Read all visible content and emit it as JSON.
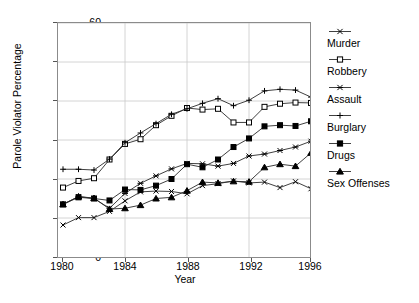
{
  "chart_data": {
    "type": "line",
    "title": "",
    "xlabel": "Year",
    "ylabel": "Parole Violator Percentage",
    "xlim": [
      1980,
      1996
    ],
    "ylim": [
      0,
      60
    ],
    "xticks": [
      1980,
      1984,
      1988,
      1992,
      1996
    ],
    "yticks": [
      0,
      10,
      20,
      30,
      40,
      50,
      60
    ],
    "grid": true,
    "legend_position": "right",
    "x": [
      1980,
      1981,
      1982,
      1983,
      1984,
      1985,
      1986,
      1987,
      1988,
      1989,
      1990,
      1991,
      1992,
      1993,
      1994,
      1995,
      1996
    ],
    "series": [
      {
        "name": "Murder",
        "marker": "x",
        "values": [
          8.2,
          10.1,
          10.1,
          11.7,
          14.4,
          16.7,
          16.9,
          16.8,
          16.2,
          18.3,
          18.8,
          19.5,
          19.0,
          19.2,
          17.8,
          19.3,
          17.5
        ]
      },
      {
        "name": "Robbery",
        "marker": "square-open",
        "values": [
          17.8,
          19.5,
          20.2,
          25.0,
          29.0,
          30.2,
          33.8,
          36.2,
          38.2,
          37.8,
          38.0,
          34.5,
          34.5,
          38.5,
          39.3,
          39.6,
          39.5
        ]
      },
      {
        "name": "Assault",
        "marker": "asterisk",
        "values": [
          13.5,
          15.5,
          15.0,
          12.5,
          16.3,
          18.9,
          20.8,
          22.6,
          24.0,
          23.9,
          23.3,
          24.0,
          25.9,
          26.4,
          27.3,
          28.2,
          29.7
        ]
      },
      {
        "name": "Burglary",
        "marker": "plus",
        "values": [
          22.5,
          22.5,
          22.3,
          25.1,
          29.3,
          31.8,
          34.2,
          36.6,
          38.0,
          39.4,
          40.6,
          38.8,
          40.2,
          42.6,
          43.0,
          42.8,
          41.0
        ]
      },
      {
        "name": "Drugs",
        "marker": "square-filled",
        "values": [
          13.5,
          15.3,
          15.0,
          14.5,
          17.3,
          17.2,
          18.3,
          20.0,
          23.8,
          23.0,
          25.0,
          28.2,
          30.4,
          33.5,
          33.8,
          33.6,
          34.8
        ]
      },
      {
        "name": "Sex Offenses",
        "marker": "triangle-filled",
        "values": [
          13.5,
          15.5,
          15.1,
          12.3,
          12.5,
          13.3,
          15.0,
          15.3,
          17.0,
          19.2,
          19.0,
          19.4,
          19.3,
          23.0,
          23.8,
          23.3,
          26.7
        ]
      }
    ]
  },
  "legend": {
    "items": [
      {
        "label": "Murder"
      },
      {
        "label": "Robbery"
      },
      {
        "label": "Assault"
      },
      {
        "label": "Burglary"
      },
      {
        "label": "Drugs"
      },
      {
        "label": "Sex Offenses"
      }
    ]
  },
  "axes": {
    "y_title": "Parole Violator Percentage",
    "x_title": "Year",
    "y_ticks": [
      "0",
      "10",
      "20",
      "30",
      "40",
      "50",
      "60"
    ],
    "x_ticks": [
      "1980",
      "1984",
      "1988",
      "1992",
      "1996"
    ]
  }
}
